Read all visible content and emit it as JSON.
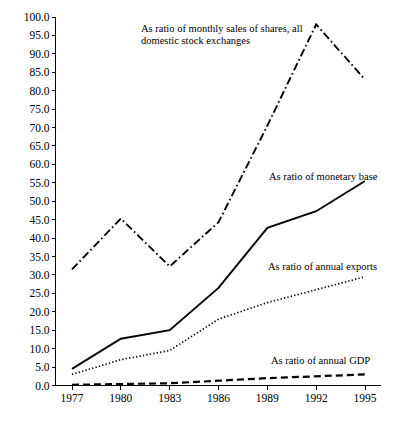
{
  "chart_data": {
    "type": "line",
    "title": "",
    "xlabel": "",
    "ylabel": "",
    "categories": [
      "1977",
      "1980",
      "1983",
      "1986",
      "1989",
      "1992",
      "1995"
    ],
    "x": [
      1977,
      1980,
      1983,
      1986,
      1989,
      1992,
      1995
    ],
    "ylim": [
      0.0,
      100.0
    ],
    "ytick_step": 5.0,
    "ytick_labels": [
      "0.0",
      "5.0",
      "10.0",
      "15.0",
      "20.0",
      "25.0",
      "30.0",
      "35.0",
      "40.0",
      "45.0",
      "50.0",
      "55.0",
      "60.0",
      "65.0",
      "70.0",
      "75.0",
      "80.0",
      "85.0",
      "90.0",
      "95.0",
      "100.0"
    ],
    "grid": false,
    "legend_position": "inline-annotations",
    "series": [
      {
        "name": "As ratio of monthly sales of shares, all domestic stock exchanges",
        "style": "dash-dot",
        "color": "#000000",
        "values": [
          31.5,
          45.3,
          32.3,
          44.3,
          70.5,
          98.0,
          83.0
        ]
      },
      {
        "name": "As ratio of monetary base",
        "style": "solid",
        "color": "#000000",
        "values": [
          4.5,
          12.7,
          15.0,
          26.5,
          42.8,
          47.3,
          55.5
        ]
      },
      {
        "name": "As ratio of annual exports",
        "style": "dotted",
        "color": "#000000",
        "values": [
          3.0,
          7.0,
          9.5,
          18.0,
          22.5,
          26.0,
          29.5
        ]
      },
      {
        "name": "As ratio of annual GDP",
        "style": "dashed",
        "color": "#000000",
        "values": [
          0.2,
          0.4,
          0.6,
          1.3,
          2.0,
          2.5,
          3.0
        ]
      }
    ],
    "annotations": [
      {
        "id": "stock-sales",
        "line1": "As ratio of monthly sales of shares, all",
        "line2": "domestic stock exchanges"
      },
      {
        "id": "monetary-base",
        "line1": "As ratio of monetary base",
        "line2": ""
      },
      {
        "id": "annual-exports",
        "line1": "As ratio of annual exports",
        "line2": ""
      },
      {
        "id": "annual-gdp",
        "line1": "As ratio of annual GDP",
        "line2": ""
      }
    ]
  }
}
